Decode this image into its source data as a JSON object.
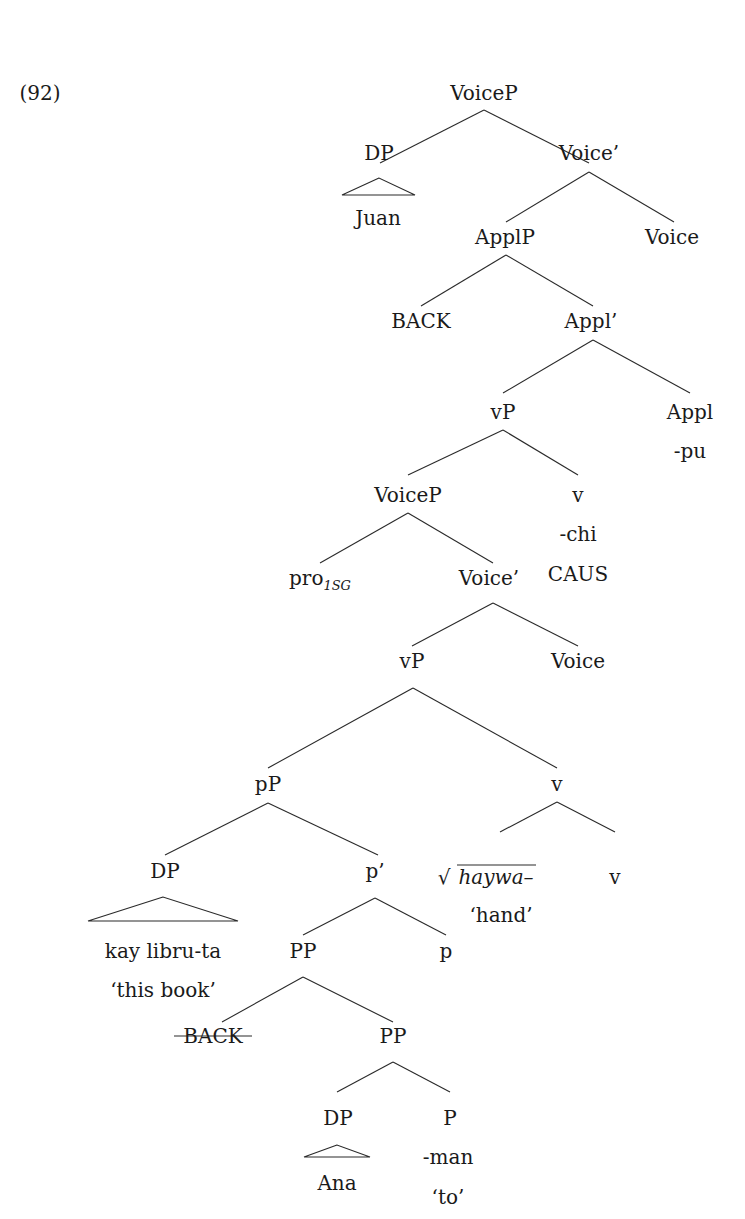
{
  "example_number": "(92)",
  "tree": {
    "root": "VoiceP",
    "nodes": {
      "n_voiceP_top": "VoiceP",
      "n_dp_juan": "DP",
      "n_juan": "Juan",
      "n_voicebar_top": "Voice’",
      "n_applP": "ApplP",
      "n_voice_top": "Voice",
      "n_back": "BACK",
      "n_applbar": "Appl’",
      "n_vP_top": "vP",
      "n_appl": "Appl",
      "n_pu": "-pu",
      "n_voiceP_low": "VoiceP",
      "n_v_caus": "v",
      "n_chi": "-chi",
      "n_caus": "CAUS",
      "n_pro": "pro",
      "n_pro_sub": "1SG",
      "n_voicebar_low": "Voice’",
      "n_vP_low": "vP",
      "n_voice_low": "Voice",
      "n_pP": "pP",
      "n_v_mid": "v",
      "n_dp_book": "DP",
      "n_pbar": "p’",
      "n_root": "haywa–",
      "n_v_low": "v",
      "n_hand": "‘hand’",
      "n_kay": "kay libru-ta",
      "n_thisbook": "‘this book’",
      "n_PP_upper": "PP",
      "n_p": "p",
      "n_back_struck": "BACK",
      "n_PP_lower": "PP",
      "n_dp_ana": "DP",
      "n_P": "P",
      "n_ana": "Ana",
      "n_man": "-man",
      "n_to": "‘to’"
    }
  }
}
